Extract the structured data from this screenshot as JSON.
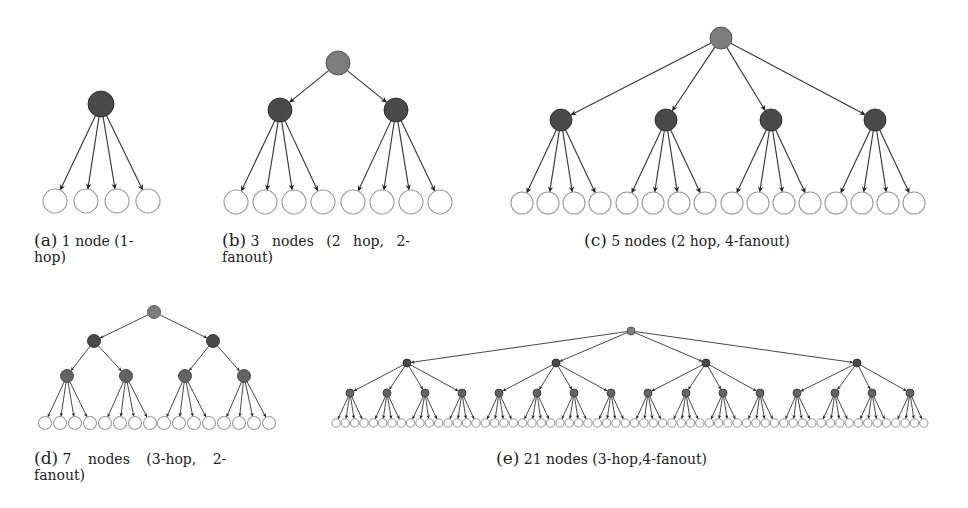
{
  "colors": {
    "root_fill": "#7c7c7c",
    "internal_fill": "#4a4a4a",
    "level2_fill": "#646464",
    "leaf_stroke": "#9a9a9a",
    "leaf_fill": "#ffffff",
    "edge": "#333333"
  },
  "subfigures": [
    {
      "id": "a",
      "tag": "(a)",
      "caption": "1 node (1-hop)",
      "caption_line1": "1 node (1-",
      "caption_line2": "hop)",
      "hops": 1,
      "fanout": 4,
      "internal_nodes": 1,
      "levels": [
        {
          "y": 104,
          "r": 13,
          "xs": [
            101
          ],
          "kind": "internal"
        },
        {
          "y": 201,
          "r": 12,
          "xs": [
            55,
            86,
            117,
            148
          ],
          "kind": "leaf"
        }
      ]
    },
    {
      "id": "b",
      "tag": "(b)",
      "caption": "3 nodes (2 hop, 2-fanout)",
      "caption_line1": "3 nodes (2 hop, 2-",
      "caption_line2": "fanout)",
      "hops": 2,
      "fanout": 2,
      "internal_nodes": 3,
      "levels": [
        {
          "y": 63,
          "r": 12,
          "xs": [
            338
          ],
          "kind": "root"
        },
        {
          "y": 110,
          "r": 12,
          "xs": [
            280,
            396
          ],
          "kind": "internal"
        },
        {
          "y": 202,
          "r": 12,
          "xs": [
            236,
            265,
            294,
            323,
            353,
            382,
            411,
            440
          ],
          "kind": "leaf"
        }
      ]
    },
    {
      "id": "c",
      "tag": "(c)",
      "caption": "5 nodes (2 hop, 4-fanout)",
      "caption_line1": "5 nodes (2 hop, 4-fanout)",
      "caption_line2": "",
      "hops": 2,
      "fanout": 4,
      "internal_nodes": 5,
      "levels": [
        {
          "y": 38,
          "r": 11,
          "xs": [
            721
          ],
          "kind": "root"
        },
        {
          "y": 120,
          "r": 11,
          "xs": [
            561,
            666,
            771,
            875
          ],
          "kind": "internal"
        },
        {
          "y": 203,
          "r": 11,
          "xs": [
            522,
            548,
            574,
            600,
            627,
            653,
            679,
            705,
            732,
            758,
            784,
            810,
            836,
            862,
            888,
            914
          ],
          "kind": "leaf"
        }
      ]
    },
    {
      "id": "d",
      "tag": "(d)",
      "caption": "7 nodes (3-hop, 2-fanout)",
      "caption_line1": "7 nodes (3-hop, 2-",
      "caption_line2": "fanout)",
      "hops": 3,
      "fanout": 2,
      "internal_nodes": 7,
      "levels": [
        {
          "y": 312,
          "r": 6.5,
          "xs": [
            154
          ],
          "kind": "root"
        },
        {
          "y": 341,
          "r": 6.5,
          "xs": [
            94,
            213
          ],
          "kind": "internal"
        },
        {
          "y": 376,
          "r": 6.5,
          "xs": [
            67,
            126,
            185,
            244
          ],
          "kind": "level2"
        },
        {
          "y": 423,
          "r": 6.5,
          "xs": [
            45,
            60,
            75,
            90,
            105,
            120,
            135,
            150,
            164,
            179,
            194,
            209,
            224,
            239,
            254,
            269
          ],
          "kind": "leaf"
        }
      ]
    },
    {
      "id": "e",
      "tag": "(e)",
      "caption": "21 nodes (3-hop,4-fanout)",
      "caption_line1": "21 nodes (3-hop,4-fanout)",
      "caption_line2": "",
      "hops": 3,
      "fanout": 4,
      "internal_nodes": 21,
      "levels": [
        {
          "y": 331,
          "r": 4,
          "xs": [
            631
          ],
          "kind": "root"
        },
        {
          "y": 363,
          "r": 4,
          "xs": [
            407,
            556,
            706,
            857
          ],
          "kind": "internal"
        },
        {
          "y": 393,
          "r": 4,
          "xs": [
            350,
            387,
            425,
            462,
            499,
            537,
            574,
            611,
            648,
            686,
            723,
            760,
            797,
            835,
            872,
            910
          ],
          "kind": "level2"
        },
        {
          "y": 423,
          "r": 4.2,
          "leaf_start": 336,
          "leaf_step": 9.33,
          "leaf_count": 64,
          "kind": "leaf"
        }
      ]
    }
  ]
}
